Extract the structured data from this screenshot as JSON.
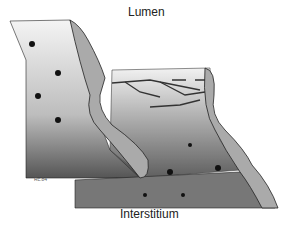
{
  "labels": {
    "top": "Lumen",
    "bottom": "Interstitium",
    "signature": "Rc.84"
  },
  "figure": {
    "elements": [
      "left-cell-block",
      "cell-membrane-left",
      "tight-junction-strands",
      "cell-membrane-right",
      "right-cell-block",
      "nuclei-spots"
    ]
  }
}
